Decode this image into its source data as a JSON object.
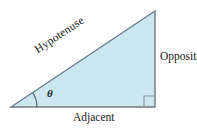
{
  "figure": {
    "background_color": "#ffffff",
    "fill_color": "#cbe8f2",
    "stroke_color": "#6e7c86",
    "text_color": "#1a1a1a",
    "labels": {
      "hypotenuse": "Hypotenuse",
      "opposite": "Opposite",
      "adjacent": "Adjacent",
      "angle": "θ"
    },
    "geometry": {
      "vertices": {
        "left": [
          11,
          107
        ],
        "top_right": [
          155,
          11
        ],
        "bottom_right": [
          155,
          107
        ]
      },
      "hypotenuse_rotation_deg": -33.7,
      "right_angle_marker": {
        "x": 144,
        "y": 96,
        "size": 11
      },
      "angle_arc_radius": 26
    }
  }
}
